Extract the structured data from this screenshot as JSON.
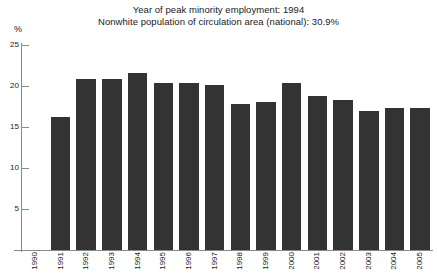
{
  "chart_data": {
    "type": "bar",
    "title": "Year of peak minority employment: 1994",
    "subtitle": "Nonwhite population of circulation area (national): 30.9%",
    "clipped_title_above": "",
    "xlabel": "",
    "ylabel": "%",
    "ylim": [
      0,
      25
    ],
    "yticks": [
      5,
      10,
      15,
      20,
      25
    ],
    "ytick_labels": [
      "5",
      "10",
      "15",
      "20",
      "25"
    ],
    "grid": false,
    "legend": null,
    "bar_color": "#333333",
    "axis_color": "#8a8a8a",
    "categories": [
      "1990",
      "1991",
      "1992",
      "1993",
      "1994",
      "1995",
      "1996",
      "1997",
      "1998",
      "1999",
      "2000",
      "2001",
      "2002",
      "2003",
      "2004",
      "2005"
    ],
    "values": [
      0,
      16.2,
      20.9,
      20.9,
      21.6,
      20.4,
      20.4,
      20.1,
      17.8,
      18.0,
      20.4,
      18.8,
      18.3,
      17.0,
      17.3,
      17.3
    ],
    "annotations": [
      "Year of peak minority employment: 1994",
      "Nonwhite population of circulation area (national): 30.9%"
    ]
  }
}
